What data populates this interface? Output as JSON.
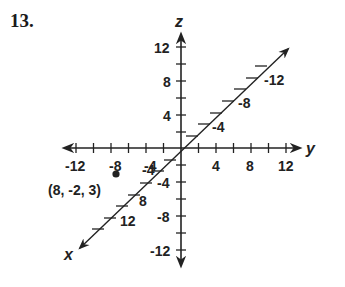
{
  "problem": {
    "number": "13."
  },
  "axes": {
    "x": {
      "name": "x",
      "tick_labels": [
        "-4",
        "8",
        "12"
      ],
      "upper_labels": [
        "-4",
        "-8",
        "-12"
      ]
    },
    "y": {
      "name": "y",
      "tick_labels": [
        "-12",
        "-8",
        "-4",
        "4",
        "8",
        "12"
      ]
    },
    "z": {
      "name": "z",
      "tick_labels": [
        "12",
        "8",
        "4",
        "-4",
        "-8",
        "-12"
      ]
    }
  },
  "point": {
    "label": "(8, -2, 3)"
  },
  "colors": {
    "ink": "#222222",
    "background": "#ffffff"
  }
}
